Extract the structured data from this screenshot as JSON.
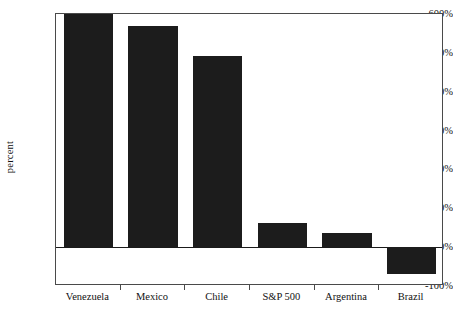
{
  "chart_data": {
    "type": "bar",
    "title": "",
    "subtitle": "",
    "xlabel": "",
    "ylabel": "percent",
    "categories": [
      "Venezuela",
      "Mexico",
      "Chile",
      "S&P 500",
      "Argentina",
      "Brazil"
    ],
    "values": [
      620,
      568,
      493,
      62,
      37,
      -69
    ],
    "value_labels": [
      "620%",
      "568%",
      "493%",
      "62%",
      "37%",
      "-69%"
    ],
    "ylim": [
      -100,
      600
    ],
    "ytick_values": [
      -100,
      0,
      100,
      200,
      300,
      400,
      500,
      600
    ],
    "ytick_labels": [
      "-100%",
      "0%",
      "100%",
      "200%",
      "300%",
      "400%",
      "500%",
      "600%"
    ],
    "grid": false,
    "legend": null,
    "legend_position": "none",
    "colors": {
      "bar_fill": "#1c1c1c",
      "axis": "#4a4a4a",
      "text": "#111111",
      "background": "#ffffff",
      "zero_line": "#1a1a1a"
    }
  }
}
